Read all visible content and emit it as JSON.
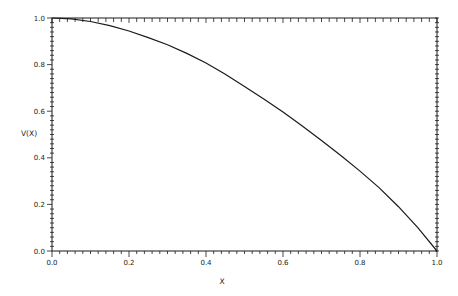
{
  "chart_data": {
    "type": "line",
    "title": "",
    "xlabel": "X",
    "ylabel": "V(X)",
    "xlim": [
      0.0,
      1.0
    ],
    "ylim": [
      0.0,
      1.0
    ],
    "grid": false,
    "legend": null,
    "x_ticks": [
      "0.0",
      "0.2",
      "0.4",
      "0.6",
      "0.8",
      "1.0"
    ],
    "y_ticks": [
      "0.0",
      "0.2",
      "0.4",
      "0.6",
      "0.8",
      "1.0"
    ],
    "minor_tick_step": 0.02,
    "series": [
      {
        "name": "V(X)",
        "color": "#1a1a1a",
        "x": [
          0.0,
          0.05,
          0.1,
          0.15,
          0.2,
          0.25,
          0.3,
          0.35,
          0.4,
          0.45,
          0.5,
          0.55,
          0.6,
          0.65,
          0.7,
          0.75,
          0.8,
          0.85,
          0.9,
          0.95,
          1.0
        ],
        "y": [
          1.0,
          0.996,
          0.985,
          0.967,
          0.944,
          0.916,
          0.885,
          0.848,
          0.807,
          0.759,
          0.706,
          0.653,
          0.597,
          0.537,
          0.474,
          0.41,
          0.343,
          0.271,
          0.19,
          0.1,
          0.0
        ]
      }
    ]
  }
}
